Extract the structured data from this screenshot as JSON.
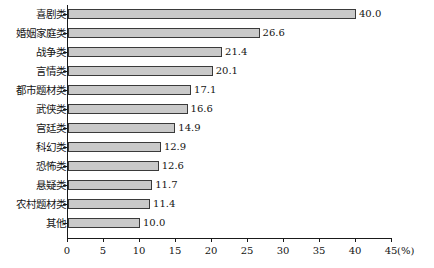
{
  "chart_data": {
    "type": "bar",
    "orientation": "horizontal",
    "title": "",
    "xlabel": "(%)",
    "ylabel": "",
    "xlim": [
      0,
      45
    ],
    "xticks": [
      0,
      5,
      10,
      15,
      20,
      25,
      30,
      35,
      40,
      45
    ],
    "xtick_labels": [
      "0",
      "5",
      "10",
      "15",
      "20",
      "25",
      "30",
      "35",
      "40",
      "45"
    ],
    "unit_label": "(%)",
    "grid": false,
    "legend": null,
    "bar_fill_color": "#c9c9c9",
    "bar_border_color": "#3a3a3a",
    "axis_color": "#1a1a1a",
    "categories": [
      "喜剧类",
      "婚姻家庭类",
      "战争类",
      "言情类",
      "都市题材类",
      "武侠类",
      "宫廷类",
      "科幻类",
      "恐怖类",
      "悬疑类",
      "农村题材类",
      "其他"
    ],
    "values": [
      40.0,
      26.6,
      21.4,
      20.1,
      17.1,
      16.6,
      14.9,
      12.9,
      12.6,
      11.7,
      11.4,
      10.0
    ],
    "value_labels": [
      "40.0",
      "26.6",
      "21.4",
      "20.1",
      "17.1",
      "16.6",
      "14.9",
      "12.9",
      "12.6",
      "11.7",
      "11.4",
      "10.0"
    ],
    "bars": [
      {
        "category": "喜剧类",
        "value": 40.0,
        "label": "40.0"
      },
      {
        "category": "婚姻家庭类",
        "value": 26.6,
        "label": "26.6"
      },
      {
        "category": "战争类",
        "value": 21.4,
        "label": "21.4"
      },
      {
        "category": "言情类",
        "value": 20.1,
        "label": "20.1"
      },
      {
        "category": "都市题材类",
        "value": 17.1,
        "label": "17.1"
      },
      {
        "category": "武侠类",
        "value": 16.6,
        "label": "16.6"
      },
      {
        "category": "宫廷类",
        "value": 14.9,
        "label": "14.9"
      },
      {
        "category": "科幻类",
        "value": 12.9,
        "label": "12.9"
      },
      {
        "category": "恐怖类",
        "value": 12.6,
        "label": "12.6"
      },
      {
        "category": "悬疑类",
        "value": 11.7,
        "label": "11.7"
      },
      {
        "category": "农村题材类",
        "value": 11.4,
        "label": "11.4"
      },
      {
        "category": "其他",
        "value": 10.0,
        "label": "10.0"
      }
    ]
  }
}
